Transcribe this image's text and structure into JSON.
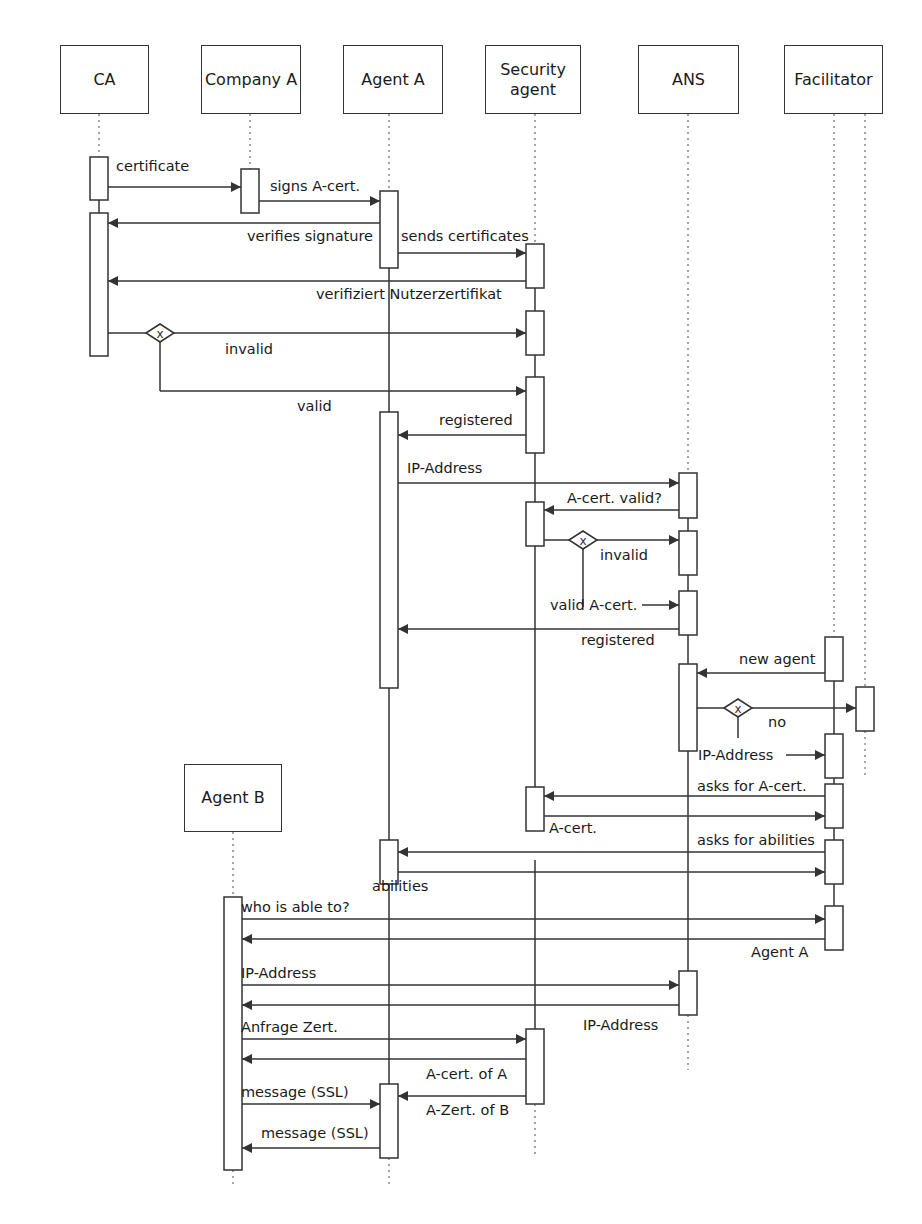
{
  "participants": [
    {
      "id": "ca",
      "label": "CA",
      "x": 60,
      "y": 45,
      "w": 89,
      "h": 69,
      "lifeline_x": 99,
      "dot_to": 157
    },
    {
      "id": "company_a",
      "label": "Company A",
      "x": 201,
      "y": 45,
      "w": 100,
      "h": 69,
      "lifeline_x": 250,
      "dot_to": 169
    },
    {
      "id": "agent_a",
      "label": "Agent A",
      "x": 343,
      "y": 45,
      "w": 100,
      "h": 69,
      "lifeline_x": 389,
      "dot_to": 191
    },
    {
      "id": "security_agent",
      "label": "Security agent",
      "x": 485,
      "y": 45,
      "w": 96,
      "h": 69,
      "lifeline_x": 535,
      "dot_to": 244
    },
    {
      "id": "ans",
      "label": "ANS",
      "x": 638,
      "y": 45,
      "w": 101,
      "h": 69,
      "lifeline_x": 688,
      "dot_to": 473
    },
    {
      "id": "facilitator",
      "label": "Facilitator",
      "x": 784,
      "y": 45,
      "w": 99,
      "h": 69,
      "lifeline_x": 834,
      "dot_to": 637
    },
    {
      "id": "agent_b",
      "label": "Agent B",
      "x": 184,
      "y": 764,
      "w": 98,
      "h": 68,
      "lifeline_x": 233,
      "dot_to": 897
    }
  ],
  "solid_lifelines": [
    [
      99,
      200,
      99,
      213
    ],
    [
      389,
      268,
      389,
      412
    ],
    [
      535,
      288,
      535,
      311
    ],
    [
      535,
      355,
      535,
      377
    ],
    [
      535,
      453,
      535,
      502
    ],
    [
      535,
      546,
      535,
      816
    ],
    [
      535,
      860,
      535,
      1029
    ],
    [
      688,
      518,
      688,
      531
    ],
    [
      688,
      575,
      688,
      591
    ],
    [
      688,
      635,
      688,
      664
    ],
    [
      688,
      751,
      688,
      971
    ],
    [
      834,
      681,
      834,
      734
    ],
    [
      834,
      778,
      834,
      784
    ],
    [
      834,
      828,
      834,
      840
    ],
    [
      834,
      884,
      834,
      906
    ],
    [
      389,
      688,
      389,
      840
    ],
    [
      389,
      884,
      389,
      1084
    ]
  ],
  "dotted_tails": [
    [
      865,
      114,
      865,
      687
    ],
    [
      865,
      731,
      865,
      777
    ],
    [
      688,
      1015,
      688,
      1070
    ],
    [
      535,
      1104,
      535,
      1158
    ],
    [
      389,
      1158,
      389,
      1186
    ],
    [
      233,
      1170,
      233,
      1188
    ]
  ],
  "activations": [
    [
      90,
      157,
      18,
      43
    ],
    [
      90,
      213,
      18,
      143
    ],
    [
      241,
      169,
      18,
      44
    ],
    [
      380,
      191,
      18,
      77
    ],
    [
      526,
      244,
      18,
      44
    ],
    [
      526,
      311,
      18,
      44
    ],
    [
      526,
      377,
      18,
      76
    ],
    [
      380,
      412,
      18,
      276
    ],
    [
      679,
      473,
      18,
      45
    ],
    [
      526,
      502,
      18,
      44
    ],
    [
      679,
      531,
      18,
      44
    ],
    [
      679,
      591,
      18,
      44
    ],
    [
      825,
      637,
      18,
      44
    ],
    [
      679,
      664,
      18,
      87
    ],
    [
      856,
      687,
      18,
      44
    ],
    [
      825,
      734,
      18,
      44
    ],
    [
      825,
      784,
      18,
      44
    ],
    [
      526,
      787,
      18,
      44
    ],
    [
      825,
      840,
      18,
      44
    ],
    [
      380,
      840,
      18,
      44
    ],
    [
      825,
      906,
      18,
      44
    ],
    [
      224,
      897,
      18,
      273
    ],
    [
      679,
      971,
      18,
      44
    ],
    [
      526,
      1029,
      18,
      75
    ],
    [
      380,
      1084,
      18,
      74
    ]
  ],
  "messages": [
    {
      "x1": 108,
      "x2": 241,
      "y": 187,
      "label": "certificate",
      "lx": 116,
      "ly": 158
    },
    {
      "x1": 259,
      "x2": 380,
      "y": 201,
      "label": "signs A-cert.",
      "lx": 270,
      "ly": 178
    },
    {
      "x1": 380,
      "x2": 108,
      "y": 223,
      "label": "verifies signature",
      "lx": 247,
      "ly": 228
    },
    {
      "x1": 398,
      "x2": 526,
      "y": 253,
      "label": "sends certificates",
      "lx": 401,
      "ly": 228
    },
    {
      "x1": 526,
      "x2": 108,
      "y": 281,
      "label": "verifiziert Nutzerzertifikat",
      "lx": 316,
      "ly": 286
    },
    {
      "x1": 108,
      "x2": 526,
      "y": 333,
      "label": "invalid",
      "lx": 225,
      "ly": 341,
      "decision_x": 160
    },
    {
      "x1": 160,
      "x2": 526,
      "y": 391,
      "label": "valid",
      "lx": 297,
      "ly": 398,
      "from_decision": true,
      "dy": 333
    },
    {
      "x1": 526,
      "x2": 398,
      "y": 435,
      "label": "registered",
      "lx": 439,
      "ly": 412
    },
    {
      "x1": 398,
      "x2": 679,
      "y": 483,
      "label": "IP-Address",
      "lx": 407,
      "ly": 460
    },
    {
      "x1": 679,
      "x2": 544,
      "y": 510,
      "label": "A-cert. valid?",
      "lx": 567,
      "ly": 490
    },
    {
      "x1": 544,
      "x2": 679,
      "y": 540,
      "label": "invalid",
      "lx": 600,
      "ly": 547,
      "decision_x": 583
    },
    {
      "x1": 642,
      "x2": 679,
      "y": 605,
      "label": "valid A-cert.",
      "lx": 550,
      "ly": 597,
      "from_decision": true,
      "dx": 583,
      "dy": 540,
      "dlen": 607
    },
    {
      "x1": 679,
      "x2": 398,
      "y": 629,
      "label": "registered",
      "lx": 581,
      "ly": 632
    },
    {
      "x1": 825,
      "x2": 697,
      "y": 673,
      "label": "new agent",
      "lx": 739,
      "ly": 651
    },
    {
      "x1": 697,
      "x2": 856,
      "y": 708,
      "label": "no",
      "lx": 768,
      "ly": 714,
      "decision_x": 738
    },
    {
      "x1": 786,
      "x2": 825,
      "y": 755,
      "label": "IP-Address",
      "lx": 698,
      "ly": 747,
      "from_decision": true,
      "dx": 738,
      "dy": 708,
      "dlen": 738
    },
    {
      "x1": 825,
      "x2": 544,
      "y": 796,
      "label": "asks for A-cert.",
      "lx": 697,
      "ly": 778
    },
    {
      "x1": 544,
      "x2": 825,
      "y": 816,
      "label": "A-cert.",
      "lx": 549,
      "ly": 820
    },
    {
      "x1": 825,
      "x2": 398,
      "y": 852,
      "label": "asks for abilities",
      "lx": 697,
      "ly": 832
    },
    {
      "x1": 398,
      "x2": 825,
      "y": 872,
      "label": "abilities",
      "lx": 372,
      "ly": 878
    },
    {
      "x1": 242,
      "x2": 825,
      "y": 919,
      "label": "who is able to?",
      "lx": 241,
      "ly": 899
    },
    {
      "x1": 825,
      "x2": 242,
      "y": 939,
      "label": "Agent A",
      "lx": 751,
      "ly": 944
    },
    {
      "x1": 242,
      "x2": 679,
      "y": 985,
      "label": "IP-Address",
      "lx": 241,
      "ly": 965
    },
    {
      "x1": 679,
      "x2": 242,
      "y": 1005,
      "label": "IP-Address",
      "lx": 583,
      "ly": 1017
    },
    {
      "x1": 242,
      "x2": 526,
      "y": 1039,
      "label": "Anfrage Zert.",
      "lx": 241,
      "ly": 1019
    },
    {
      "x1": 526,
      "x2": 242,
      "y": 1059,
      "label": "A-cert. of A",
      "lx": 426,
      "ly": 1066
    },
    {
      "x1": 526,
      "x2": 398,
      "y": 1096,
      "label": "A-Zert. of B",
      "lx": 426,
      "ly": 1102
    },
    {
      "x1": 242,
      "x2": 380,
      "y": 1104,
      "label": "message (SSL)",
      "lx": 241,
      "ly": 1084
    },
    {
      "x1": 380,
      "x2": 242,
      "y": 1148,
      "label": "message (SSL)",
      "lx": 261,
      "ly": 1125
    }
  ],
  "decision_symbol": "x",
  "colors": {
    "line": "#333333",
    "dotted": "#777777",
    "background": "#ffffff"
  }
}
